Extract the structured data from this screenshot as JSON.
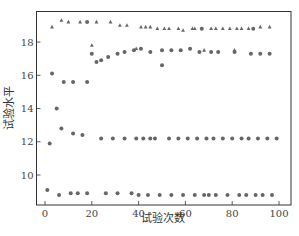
{
  "chart_data": {
    "type": "scatter",
    "title": "",
    "xlabel": "试验次数",
    "ylabel": "试验水平",
    "xlim": [
      -4,
      105
    ],
    "ylim": [
      8.2,
      19.9
    ],
    "xticks": [
      0,
      20,
      40,
      60,
      80,
      100
    ],
    "yticks": [
      10,
      12,
      14,
      16,
      18
    ],
    "grid": false,
    "legend": null,
    "colors": {
      "marker": "#666666",
      "axis": "#333333"
    },
    "series": [
      {
        "name": "circles",
        "marker": "circle",
        "points": [
          [
            1,
            9.1
          ],
          [
            2,
            11.9
          ],
          [
            3,
            16.1
          ],
          [
            5,
            14.0
          ],
          [
            6,
            8.8
          ],
          [
            7,
            12.8
          ],
          [
            8,
            15.6
          ],
          [
            11,
            8.9
          ],
          [
            12,
            12.5
          ],
          [
            12,
            15.6
          ],
          [
            14,
            8.9
          ],
          [
            16,
            12.4
          ],
          [
            18,
            15.6
          ],
          [
            18,
            8.9
          ],
          [
            18,
            19.2
          ],
          [
            20,
            17.3
          ],
          [
            22,
            16.8
          ],
          [
            24,
            12.2
          ],
          [
            24,
            16.9
          ],
          [
            26,
            8.9
          ],
          [
            27,
            17.1
          ],
          [
            29,
            12.2
          ],
          [
            31,
            8.9
          ],
          [
            31,
            17.3
          ],
          [
            34,
            12.2
          ],
          [
            34,
            17.4
          ],
          [
            37,
            8.9
          ],
          [
            38,
            17.5
          ],
          [
            39,
            12.2
          ],
          [
            40,
            8.8
          ],
          [
            41,
            17.6
          ],
          [
            42,
            12.2
          ],
          [
            44,
            8.8
          ],
          [
            45,
            12.2
          ],
          [
            45,
            17.4
          ],
          [
            47,
            12.2
          ],
          [
            49,
            8.8
          ],
          [
            50,
            16.6
          ],
          [
            50,
            17.5
          ],
          [
            53,
            12.2
          ],
          [
            54,
            8.8
          ],
          [
            54,
            17.5
          ],
          [
            57,
            12.2
          ],
          [
            58,
            17.5
          ],
          [
            59,
            8.8
          ],
          [
            61,
            12.2
          ],
          [
            62,
            17.6
          ],
          [
            64,
            8.8
          ],
          [
            65,
            12.2
          ],
          [
            66,
            17.4
          ],
          [
            67,
            18.8
          ],
          [
            68,
            8.8
          ],
          [
            69,
            12.2
          ],
          [
            70,
            8.8
          ],
          [
            71,
            17.4
          ],
          [
            72,
            12.2
          ],
          [
            73,
            8.8
          ],
          [
            74,
            17.4
          ],
          [
            76,
            12.2
          ],
          [
            78,
            8.8
          ],
          [
            80,
            12.2
          ],
          [
            81,
            17.4
          ],
          [
            83,
            8.8
          ],
          [
            84,
            12.2
          ],
          [
            86,
            8.8
          ],
          [
            87,
            12.2
          ],
          [
            88,
            17.3
          ],
          [
            89,
            18.8
          ],
          [
            90,
            8.8
          ],
          [
            91,
            12.2
          ],
          [
            92,
            17.3
          ],
          [
            93,
            8.8
          ],
          [
            95,
            12.2
          ],
          [
            96,
            17.3
          ],
          [
            97,
            8.8
          ],
          [
            99,
            12.2
          ]
        ]
      },
      {
        "name": "triangles",
        "marker": "triangle",
        "points": [
          [
            3,
            18.9
          ],
          [
            7,
            19.3
          ],
          [
            10,
            19.2
          ],
          [
            15,
            19.2
          ],
          [
            20,
            17.8
          ],
          [
            22,
            19.2
          ],
          [
            28,
            19.2
          ],
          [
            32,
            19.0
          ],
          [
            35,
            19.0
          ],
          [
            39,
            17.6
          ],
          [
            41,
            18.9
          ],
          [
            43,
            18.9
          ],
          [
            45,
            18.9
          ],
          [
            48,
            18.8
          ],
          [
            51,
            18.8
          ],
          [
            53,
            18.8
          ],
          [
            57,
            18.8
          ],
          [
            59,
            18.7
          ],
          [
            63,
            18.8
          ],
          [
            64,
            18.8
          ],
          [
            68,
            17.5
          ],
          [
            71,
            18.8
          ],
          [
            73,
            18.8
          ],
          [
            76,
            18.8
          ],
          [
            79,
            18.8
          ],
          [
            81,
            17.5
          ],
          [
            82,
            18.8
          ],
          [
            84,
            18.8
          ],
          [
            87,
            18.8
          ],
          [
            92,
            18.9
          ],
          [
            96,
            18.9
          ]
        ]
      }
    ]
  },
  "axis_labels": {
    "x": "试验次数",
    "y": "试验水平"
  },
  "tick_labels": {
    "x": [
      "0",
      "20",
      "40",
      "60",
      "80",
      "100"
    ],
    "y": [
      "10",
      "12",
      "14",
      "16",
      "18"
    ]
  }
}
